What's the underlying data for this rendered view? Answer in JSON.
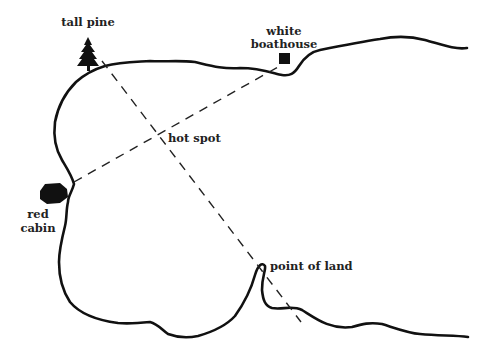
{
  "diagram": {
    "type": "lake-map",
    "colors": {
      "ink": "#111111",
      "label": "#222222",
      "background": "#ffffff"
    },
    "landmarks": [
      {
        "id": "tall-pine",
        "label": "tall pine",
        "icon": "pine-tree-icon"
      },
      {
        "id": "white-boathouse",
        "label_lines": [
          "white",
          "boathouse"
        ],
        "icon": "square-icon"
      },
      {
        "id": "red-cabin",
        "label_lines": [
          "red",
          "cabin"
        ],
        "icon": "cabin-icon"
      },
      {
        "id": "point-of-land",
        "label": "point of land"
      }
    ],
    "target": {
      "label": "hot spot"
    },
    "sight_lines": [
      {
        "from": "tall pine",
        "to": "point of land",
        "style": "dashed"
      },
      {
        "from": "red cabin",
        "to": "white boathouse",
        "style": "dashed"
      }
    ]
  }
}
